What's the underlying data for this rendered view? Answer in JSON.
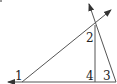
{
  "diagram": {
    "type": "geometry-angles",
    "labels": {
      "angle1": "1",
      "angle2": "2",
      "angle3": "3",
      "angle4": "4"
    },
    "colors": {
      "line": "#555555",
      "text": "#222222",
      "background": "#ffffff"
    }
  }
}
